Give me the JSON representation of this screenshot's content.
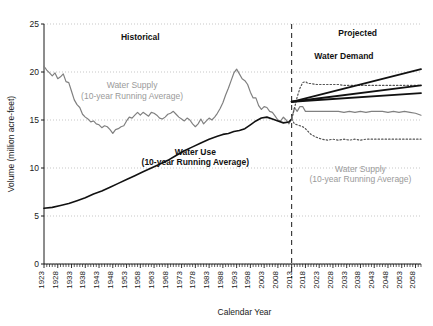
{
  "chart_data": {
    "type": "line",
    "title": "",
    "xlabel": "Calendar Year",
    "ylabel": "Volume (million acre-feet)",
    "xlim": [
      1923,
      2060
    ],
    "ylim": [
      0,
      25
    ],
    "yticks": [
      0,
      5,
      10,
      15,
      20,
      25
    ],
    "ytick_labels": [
      "0",
      "5",
      "10",
      "15",
      "20",
      "25"
    ],
    "xtick_labels": [
      "1923",
      "1928",
      "1933",
      "1938",
      "1943",
      "1948",
      "1953",
      "1958",
      "1963",
      "1968",
      "1973",
      "1978",
      "1983",
      "1988",
      "1993",
      "1998",
      "2003",
      "2008",
      "2013",
      "2018",
      "2023",
      "2028",
      "2033",
      "2038",
      "2043",
      "2048",
      "2053",
      "2058"
    ],
    "xtick_values": [
      1923,
      1928,
      1933,
      1938,
      1943,
      1948,
      1953,
      1958,
      1963,
      1968,
      1973,
      1978,
      1983,
      1988,
      1993,
      1998,
      2003,
      2008,
      2013,
      2018,
      2023,
      2028,
      2033,
      2038,
      2043,
      2048,
      2053,
      2058
    ],
    "xtick_minor_step": 1,
    "grid": "horizontal-dotted",
    "legend": "inline-annotations",
    "divider_year": 2013,
    "region_labels": [
      "Historical",
      "Projected"
    ],
    "series": [
      {
        "name": "Water Supply (10-year Running Average) - Historical",
        "style": "solid",
        "color": "#808080",
        "width": 1.2,
        "x": [
          1923,
          1924,
          1925,
          1926,
          1927,
          1928,
          1929,
          1930,
          1931,
          1932,
          1933,
          1934,
          1935,
          1936,
          1937,
          1938,
          1939,
          1940,
          1941,
          1942,
          1943,
          1944,
          1945,
          1946,
          1947,
          1948,
          1949,
          1950,
          1951,
          1952,
          1953,
          1954,
          1955,
          1956,
          1957,
          1958,
          1959,
          1960,
          1961,
          1962,
          1963,
          1964,
          1965,
          1966,
          1967,
          1968,
          1969,
          1970,
          1971,
          1972,
          1973,
          1974,
          1975,
          1976,
          1977,
          1978,
          1979,
          1980,
          1981,
          1982,
          1983,
          1984,
          1985,
          1986,
          1987,
          1988,
          1989,
          1990,
          1991,
          1992,
          1993,
          1994,
          1995,
          1996,
          1997,
          1998,
          1999,
          2000,
          2001,
          2002,
          2003,
          2004,
          2005,
          2006,
          2007,
          2008,
          2009,
          2010,
          2011,
          2012,
          2013
        ],
        "y": [
          20.6,
          20.2,
          19.9,
          19.6,
          19.9,
          19.3,
          19.5,
          19.8,
          19.0,
          18.9,
          18.0,
          17.1,
          16.6,
          16.3,
          15.6,
          15.3,
          15.1,
          14.8,
          14.9,
          14.6,
          14.5,
          14.2,
          14.4,
          14.3,
          14.0,
          13.6,
          14.0,
          14.1,
          14.3,
          14.4,
          14.9,
          15.3,
          15.2,
          15.5,
          15.8,
          15.5,
          15.8,
          15.6,
          15.4,
          15.8,
          15.7,
          15.5,
          15.2,
          15.1,
          15.3,
          15.6,
          15.7,
          15.9,
          15.6,
          15.3,
          15.1,
          14.9,
          15.2,
          15.0,
          14.6,
          14.3,
          14.6,
          15.1,
          14.6,
          14.9,
          15.2,
          15.0,
          15.3,
          15.7,
          16.2,
          16.8,
          17.6,
          18.3,
          19.1,
          19.9,
          20.3,
          19.8,
          19.3,
          19.1,
          18.7,
          17.9,
          17.3,
          17.3,
          16.5,
          16.1,
          16.4,
          16.3,
          15.9,
          15.8,
          15.4,
          15.0,
          14.9,
          15.3,
          15.0,
          14.6,
          15.1
        ]
      },
      {
        "name": "Water Use (10-year Running Average) - Historical",
        "style": "solid",
        "color": "#111111",
        "width": 1.6,
        "x": [
          1923,
          1926,
          1929,
          1932,
          1935,
          1938,
          1941,
          1944,
          1947,
          1950,
          1953,
          1956,
          1959,
          1962,
          1965,
          1968,
          1971,
          1974,
          1977,
          1980,
          1983,
          1986,
          1988,
          1990,
          1992,
          1994,
          1996,
          1998,
          2000,
          2002,
          2004,
          2006,
          2008,
          2010,
          2012,
          2013
        ],
        "y": [
          5.8,
          5.9,
          6.1,
          6.3,
          6.6,
          6.9,
          7.3,
          7.6,
          8.0,
          8.4,
          8.8,
          9.2,
          9.6,
          10.0,
          10.4,
          10.8,
          11.3,
          11.8,
          12.2,
          12.6,
          13.0,
          13.3,
          13.5,
          13.6,
          13.8,
          13.9,
          14.1,
          14.5,
          14.9,
          15.2,
          15.3,
          15.1,
          14.9,
          14.7,
          14.8,
          15.1
        ]
      },
      {
        "name": "Water Supply (10-year Running Average) - Projected median",
        "style": "solid",
        "color": "#808080",
        "width": 1.2,
        "x": [
          2013,
          2014,
          2015,
          2016,
          2017,
          2018,
          2020,
          2022,
          2024,
          2026,
          2028,
          2030,
          2032,
          2034,
          2036,
          2038,
          2040,
          2042,
          2044,
          2046,
          2048,
          2050,
          2052,
          2054,
          2056,
          2058,
          2060
        ],
        "y": [
          15.1,
          16.3,
          15.9,
          16.4,
          16.4,
          15.9,
          15.9,
          15.9,
          15.9,
          15.9,
          15.9,
          15.9,
          15.8,
          15.9,
          15.8,
          15.9,
          15.8,
          15.9,
          15.9,
          15.9,
          15.8,
          15.9,
          15.8,
          15.9,
          15.8,
          15.7,
          15.5
        ]
      },
      {
        "name": "Water Supply - Projected upper bound",
        "style": "dotted",
        "color": "#555555",
        "width": 1.2,
        "x": [
          2013,
          2014,
          2015,
          2016,
          2017,
          2018,
          2019,
          2020,
          2022,
          2024,
          2026,
          2028,
          2030,
          2032,
          2034,
          2036,
          2038,
          2040,
          2042,
          2044,
          2046,
          2048,
          2050,
          2052,
          2054,
          2056,
          2058,
          2060
        ],
        "y": [
          15.1,
          16.2,
          17.4,
          18.3,
          18.9,
          19.0,
          18.8,
          18.8,
          18.7,
          18.7,
          18.7,
          18.7,
          18.7,
          18.6,
          18.6,
          18.6,
          18.6,
          18.6,
          18.6,
          18.6,
          18.6,
          18.6,
          18.6,
          18.6,
          18.6,
          18.6,
          18.6,
          18.6
        ]
      },
      {
        "name": "Water Supply - Projected lower bound",
        "style": "dotted",
        "color": "#555555",
        "width": 1.2,
        "x": [
          2013,
          2014,
          2015,
          2016,
          2017,
          2018,
          2019,
          2020,
          2022,
          2024,
          2026,
          2028,
          2030,
          2032,
          2034,
          2036,
          2038,
          2040,
          2042,
          2044,
          2046,
          2048,
          2050,
          2052,
          2054,
          2056,
          2058,
          2060
        ],
        "y": [
          15.1,
          14.6,
          14.5,
          14.4,
          14.3,
          14.1,
          13.8,
          13.5,
          13.2,
          13.0,
          12.9,
          13.0,
          12.9,
          13.0,
          12.9,
          13.0,
          12.9,
          13.0,
          13.0,
          13.0,
          13.0,
          13.0,
          13.0,
          13.0,
          13.0,
          13.0,
          13.0,
          13.0
        ]
      },
      {
        "name": "Water Demand - Projected high",
        "style": "solid",
        "color": "#111111",
        "width": 1.8,
        "x": [
          2013,
          2060
        ],
        "y": [
          16.9,
          20.3
        ]
      },
      {
        "name": "Water Demand - Projected medium",
        "style": "solid",
        "color": "#111111",
        "width": 1.8,
        "x": [
          2013,
          2060
        ],
        "y": [
          16.9,
          18.6
        ]
      },
      {
        "name": "Water Demand - Projected low",
        "style": "solid",
        "color": "#111111",
        "width": 1.8,
        "x": [
          2013,
          2060
        ],
        "y": [
          16.9,
          17.8
        ]
      }
    ],
    "annotations": [
      {
        "id": "historical",
        "text": "Historical",
        "x": 1958,
        "y": 23.3,
        "style": "bold-dark"
      },
      {
        "id": "projected",
        "text": "Projected",
        "x": 2037,
        "y": 23.8,
        "style": "bold-dark"
      },
      {
        "id": "supply-hist-1",
        "text": "Water Supply",
        "x": 1955,
        "y": 18.3,
        "style": "gray"
      },
      {
        "id": "supply-hist-2",
        "text": "(10-year Running Average)",
        "x": 1955,
        "y": 17.2,
        "style": "gray"
      },
      {
        "id": "use-hist-1",
        "text": "Water Use",
        "x": 1978,
        "y": 11.4,
        "style": "bold-dark"
      },
      {
        "id": "use-hist-2",
        "text": "(10-year Running Average)",
        "x": 1978,
        "y": 10.3,
        "style": "bold-dark"
      },
      {
        "id": "demand-proj",
        "text": "Water Demand",
        "x": 2032,
        "y": 21.4,
        "style": "bold-dark"
      },
      {
        "id": "supply-proj-1",
        "text": "Water Supply",
        "x": 2038,
        "y": 9.6,
        "style": "gray"
      },
      {
        "id": "supply-proj-2",
        "text": "(10-year Running Average)",
        "x": 2038,
        "y": 8.5,
        "style": "gray"
      }
    ]
  }
}
